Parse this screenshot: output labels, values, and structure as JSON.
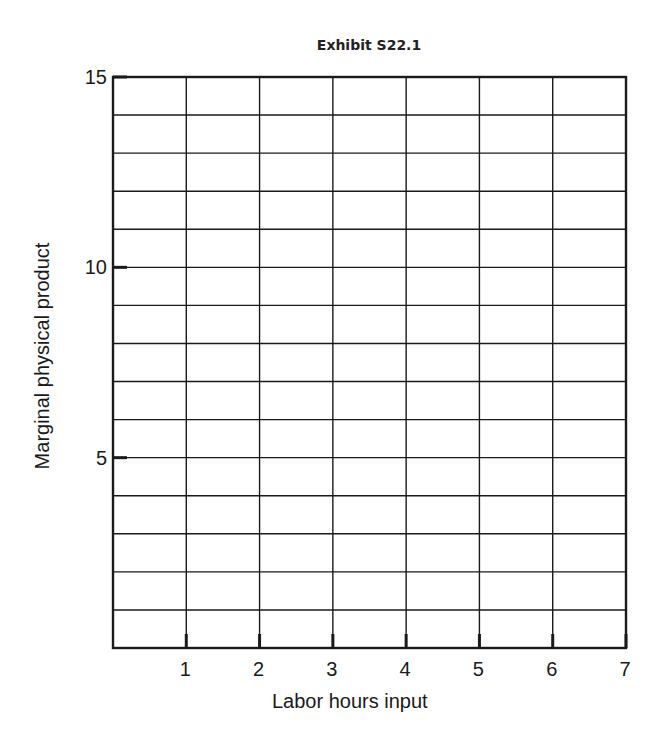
{
  "chart_data": {
    "type": "line",
    "title": "Exhibit S22.1",
    "xlabel": "Labor hours input",
    "ylabel": "Marginal physical product",
    "x_ticks": [
      "1",
      "2",
      "3",
      "4",
      "5",
      "6",
      "7"
    ],
    "y_ticks": [
      "5",
      "10",
      "15"
    ],
    "xlim": [
      0,
      7
    ],
    "ylim": [
      0,
      15
    ],
    "grid": true,
    "grid_x_step": 1,
    "grid_y_step": 1,
    "series": [],
    "legend": null
  },
  "colors": {
    "line": "#1a1a1a",
    "background": "#ffffff"
  }
}
